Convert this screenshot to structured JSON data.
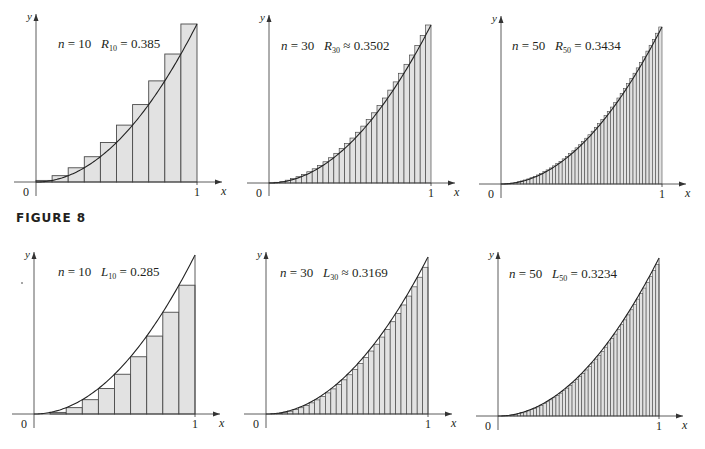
{
  "figure_label": "FIGURE 8",
  "colors": {
    "fill": "#e2e2e2",
    "stroke": "#4a4a4a",
    "axis": "#333333",
    "text": "#231f20"
  },
  "chart_data": [
    {
      "type": "bar",
      "id": "right-n10",
      "method": "right",
      "n": 10,
      "function": "y = x^2",
      "interval": [
        0,
        1
      ],
      "label_n": "n = 10",
      "label_sum_symbol": "R",
      "label_sum_sub": "10",
      "label_relation": "=",
      "label_value": "0.385",
      "sum_value": 0.385,
      "xlabel": "x",
      "ylabel": "y",
      "x_ticks": [
        "0",
        "1"
      ],
      "layout": {
        "ox": 36,
        "oy": 182,
        "x1": 197,
        "ytop": 24,
        "xend": 222,
        "yaxis_top": 14,
        "yaxis_bottom": 196,
        "label_x": 58,
        "label_y": 48
      }
    },
    {
      "type": "bar",
      "id": "right-n30",
      "method": "right",
      "n": 30,
      "function": "y = x^2",
      "interval": [
        0,
        1
      ],
      "label_n": "n = 30",
      "label_sum_symbol": "R",
      "label_sum_sub": "30",
      "label_relation": "≈",
      "label_value": "0.3502",
      "sum_value": 0.3502,
      "xlabel": "x",
      "ylabel": "y",
      "x_ticks": [
        "0",
        "1"
      ],
      "layout": {
        "ox": 269,
        "oy": 183,
        "x1": 431,
        "ytop": 25,
        "xend": 455,
        "yaxis_top": 15,
        "yaxis_bottom": 196,
        "label_x": 281,
        "label_y": 50
      }
    },
    {
      "type": "bar",
      "id": "right-n50",
      "method": "right",
      "n": 50,
      "function": "y = x^2",
      "interval": [
        0,
        1
      ],
      "label_n": "n = 50",
      "label_sum_symbol": "R",
      "label_sum_sub": "50",
      "label_relation": "=",
      "label_value": "0.3434",
      "sum_value": 0.3434,
      "xlabel": "x",
      "ylabel": "y",
      "x_ticks": [
        "0",
        "1"
      ],
      "layout": {
        "ox": 501,
        "oy": 184,
        "x1": 662,
        "ytop": 27,
        "xend": 686,
        "yaxis_top": 16,
        "yaxis_bottom": 198,
        "label_x": 512,
        "label_y": 50
      }
    },
    {
      "type": "bar",
      "id": "left-n10",
      "method": "left",
      "n": 10,
      "function": "y = x^2",
      "interval": [
        0,
        1
      ],
      "label_n": "n = 10",
      "label_sum_symbol": "L",
      "label_sum_sub": "10",
      "label_relation": "=",
      "label_value": "0.285",
      "sum_value": 0.285,
      "xlabel": "x",
      "ylabel": "y",
      "x_ticks": [
        "0",
        "1"
      ],
      "layout": {
        "ox": 34,
        "oy": 414,
        "x1": 195,
        "ytop": 255,
        "xend": 220,
        "yaxis_top": 252,
        "yaxis_bottom": 428,
        "label_x": 58,
        "label_y": 276
      }
    },
    {
      "type": "bar",
      "id": "left-n30",
      "method": "left",
      "n": 30,
      "function": "y = x^2",
      "interval": [
        0,
        1
      ],
      "label_n": "n = 30",
      "label_sum_symbol": "L",
      "label_sum_sub": "30",
      "label_relation": "≈",
      "label_value": "0.3169",
      "sum_value": 0.3169,
      "xlabel": "x",
      "ylabel": "y",
      "x_ticks": [
        "0",
        "1"
      ],
      "layout": {
        "ox": 266,
        "oy": 414,
        "x1": 428,
        "ytop": 257,
        "xend": 452,
        "yaxis_top": 252,
        "yaxis_bottom": 428,
        "label_x": 280,
        "label_y": 277
      }
    },
    {
      "type": "bar",
      "id": "left-n50",
      "method": "left",
      "n": 50,
      "function": "y = x^2",
      "interval": [
        0,
        1
      ],
      "label_n": "n = 50",
      "label_sum_symbol": "L",
      "label_sum_sub": "50",
      "label_relation": "=",
      "label_value": "0.3234",
      "sum_value": 0.3234,
      "xlabel": "x",
      "ylabel": "y",
      "x_ticks": [
        "0",
        "1"
      ],
      "layout": {
        "ox": 498,
        "oy": 416,
        "x1": 659,
        "ytop": 258,
        "xend": 683,
        "yaxis_top": 252,
        "yaxis_bottom": 430,
        "label_x": 509,
        "label_y": 278
      }
    }
  ]
}
